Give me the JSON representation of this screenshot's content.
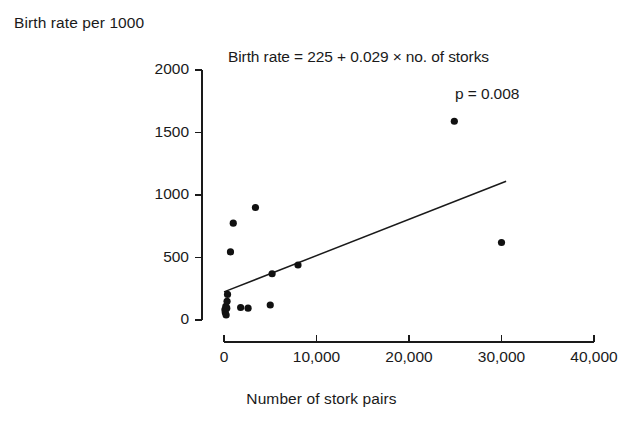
{
  "chart_data": {
    "type": "scatter",
    "title": "",
    "xlabel": "Number of stork pairs",
    "ylabel": "Birth rate per 1000",
    "xlim": [
      0,
      40000
    ],
    "ylim": [
      0,
      2000
    ],
    "xticks": [
      0,
      10000,
      20000,
      30000,
      40000
    ],
    "xtick_labels": [
      "0",
      "10,000",
      "20,000",
      "30,000",
      "40,000"
    ],
    "yticks": [
      0,
      500,
      1000,
      1500,
      2000
    ],
    "ytick_labels": [
      "0",
      "500",
      "1000",
      "1500",
      "2000"
    ],
    "grid": false,
    "legend": null,
    "annotations": {
      "equation": "Birth rate = 225 + 0.029 × no. of storks",
      "p_value": "p = 0.008"
    },
    "fit": {
      "type": "linear",
      "intercept": 225,
      "slope": 0.029,
      "p": 0.008,
      "x_start": 0,
      "x_end": 30500,
      "y_start": 225,
      "y_end": 1110
    },
    "points": [
      {
        "x": 100,
        "y": 83
      },
      {
        "x": 140,
        "y": 60
      },
      {
        "x": 200,
        "y": 110
      },
      {
        "x": 230,
        "y": 40
      },
      {
        "x": 300,
        "y": 95
      },
      {
        "x": 330,
        "y": 150
      },
      {
        "x": 380,
        "y": 205
      },
      {
        "x": 700,
        "y": 545
      },
      {
        "x": 1000,
        "y": 775
      },
      {
        "x": 1800,
        "y": 100
      },
      {
        "x": 2600,
        "y": 95
      },
      {
        "x": 3400,
        "y": 900
      },
      {
        "x": 5000,
        "y": 120
      },
      {
        "x": 5200,
        "y": 370
      },
      {
        "x": 8000,
        "y": 440
      },
      {
        "x": 24900,
        "y": 1590
      },
      {
        "x": 30000,
        "y": 620
      }
    ]
  },
  "style": {
    "axis_color": "#1a1a1a",
    "point_color": "#111111",
    "line_color": "#1a1a1a",
    "background": "#ffffff"
  }
}
